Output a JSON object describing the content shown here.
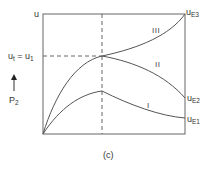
{
  "figure": {
    "caption": "(c)",
    "y_axis_label": "u",
    "left_marker": {
      "main": "u",
      "sub": "t",
      "eq": " = u",
      "sub2": "1"
    },
    "arrow_label": {
      "main": "P",
      "sub": "2"
    },
    "end_labels": [
      {
        "main": "u",
        "sub": "E3"
      },
      {
        "main": "u",
        "sub": "E2"
      },
      {
        "main": "u",
        "sub": "E1"
      }
    ],
    "curve_labels": [
      "III",
      "II",
      "I"
    ],
    "colors": {
      "line": "#555555",
      "dash": "#555555",
      "text": "#333333"
    }
  }
}
